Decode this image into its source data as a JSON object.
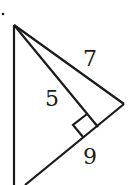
{
  "diagram": {
    "type": "geometry-triangle",
    "labels": {
      "hypotenuse": "7",
      "altitude": "5",
      "base_segment": "9"
    },
    "right_angle_marker": true,
    "stroke_color": "#1a1a1a",
    "background": "#ffffff"
  }
}
